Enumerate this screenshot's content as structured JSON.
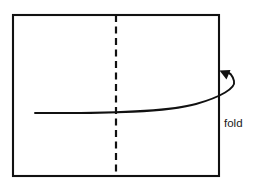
{
  "figure": {
    "background_color": "#ffffff",
    "line_color": "#111111",
    "width": 267,
    "height": 185,
    "paper": {
      "name": "sheet-of-paper",
      "x": 13,
      "y": 15,
      "width": 206,
      "height": 161,
      "stroke_width": 2.1
    },
    "fold_line": {
      "name": "vertical-fold-crease",
      "x": 116,
      "y_start": 15,
      "y_end": 176,
      "style": "dashed",
      "dash_pattern": "7 4.5"
    },
    "fold_arrow": {
      "name": "fold-direction-arrow",
      "start_x": 35,
      "start_y": 113,
      "tip_x": 222,
      "tip_y": 72,
      "direction": "up-left"
    },
    "label": {
      "text": "fold",
      "x": 224,
      "y": 127
    }
  }
}
